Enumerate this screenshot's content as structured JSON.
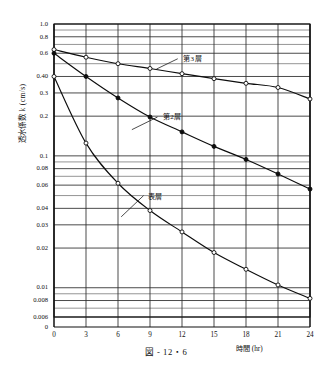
{
  "figure": {
    "caption": "図 - 12・6",
    "yaxis_title": "透水係数 k (cm/s)",
    "xaxis_title": "時間 (hr)"
  },
  "chart_data": {
    "type": "line",
    "title": "図 - 12・6",
    "xlabel": "時間 (hr)",
    "ylabel": "透水係数 k (cm/s)",
    "xlim": [
      0,
      24
    ],
    "ylim": [
      0.006,
      1.0
    ],
    "yscale": "log",
    "xscale": "linear",
    "grid": true,
    "legend": "inline-annotations",
    "x": [
      0,
      3,
      6,
      9,
      12,
      15,
      18,
      21,
      24
    ],
    "xticks": [
      "0",
      "3",
      "6",
      "9",
      "12",
      "15",
      "18",
      "21",
      "24"
    ],
    "yticks": [
      1.0,
      0.8,
      0.6,
      0.4,
      0.3,
      0.2,
      0.1,
      0.08,
      0.06,
      0.04,
      0.03,
      0.02,
      0.01,
      0.008,
      0.006
    ],
    "ytick_labels": [
      "1.0",
      "0.8",
      "0.6",
      "0.40",
      "0.3",
      "0.2",
      "0.1",
      "0.08",
      "0.06",
      "0.04",
      "0.03",
      "0.02",
      "0.01",
      "0.008",
      "0.006"
    ],
    "yorigin_label": "0",
    "series": [
      {
        "name": "第3層",
        "marker": "open-circle",
        "values": [
          0.64,
          0.56,
          0.5,
          0.46,
          0.42,
          0.385,
          0.355,
          0.33,
          0.27
        ]
      },
      {
        "name": "第2層",
        "marker": "filled-circle",
        "values": [
          0.6,
          0.4,
          0.275,
          0.197,
          0.152,
          0.118,
          0.094,
          0.073,
          0.056
        ]
      },
      {
        "name": "表層",
        "marker": "open-circle",
        "values": [
          0.4,
          0.125,
          0.062,
          0.0385,
          0.0265,
          0.0185,
          0.0138,
          0.0105,
          0.0083
        ]
      }
    ]
  },
  "annotations": [
    {
      "text": "第3層",
      "x": 12.1,
      "y": 0.55
    },
    {
      "text": "第2層",
      "x": 10.2,
      "y": 0.2
    },
    {
      "text": "表層",
      "x": 8.8,
      "y": 0.05
    }
  ]
}
